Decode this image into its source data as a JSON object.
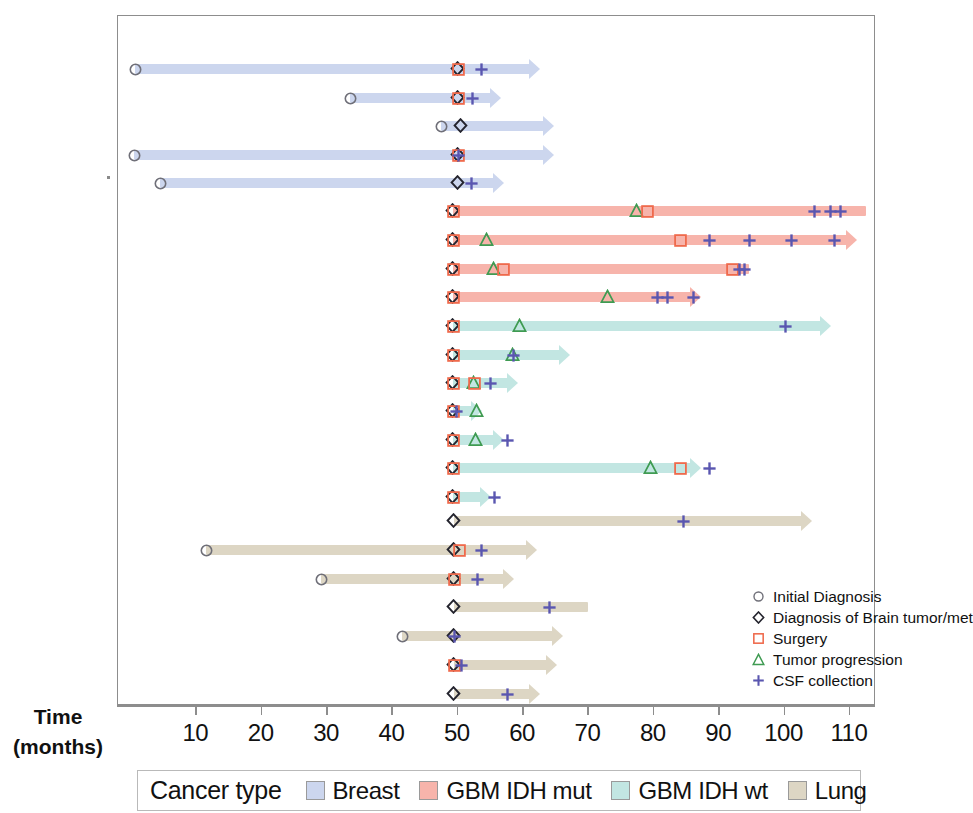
{
  "axis": {
    "title_line1": "Time",
    "title_line2": "(months)",
    "ticks": [
      10,
      20,
      30,
      40,
      50,
      60,
      70,
      80,
      90,
      100,
      110
    ],
    "tick_labels": [
      "10",
      "20",
      "30",
      "40",
      "50",
      "60",
      "70",
      "80",
      "90",
      "100",
      "110"
    ],
    "range": [
      0,
      116
    ]
  },
  "event_legend": {
    "items": [
      {
        "glyph": "circle-icon",
        "label": "Initial Diagnosis",
        "color": "#6f6f78"
      },
      {
        "glyph": "diamond-icon",
        "label": "Diagnosis of Brain tumor/met",
        "color": "#24242e"
      },
      {
        "glyph": "square-icon",
        "label": "Surgery",
        "color": "#ef6a4c"
      },
      {
        "glyph": "triangle-icon",
        "label": "Tumor progression",
        "color": "#3f9b52"
      },
      {
        "glyph": "plus-icon",
        "label": "CSF collection",
        "color": "#5a56b0"
      }
    ]
  },
  "cancer_legend": {
    "title": "Cancer type",
    "items": [
      {
        "label": "Breast",
        "color": "#ccd6ee"
      },
      {
        "label": "GBM IDH mut",
        "color": "#f7b4ab"
      },
      {
        "label": "GBM IDH wt",
        "color": "#c2e6e2"
      },
      {
        "label": "Lung",
        "color": "#ddd6c4"
      }
    ]
  },
  "chart_data": {
    "type": "timeline",
    "title": "",
    "xlabel": "Time (months)",
    "ylabel": "",
    "xlim": [
      0,
      116
    ],
    "grid": false,
    "legend_position": "inside-bottom-right",
    "event_types": [
      "Initial Diagnosis",
      "Diagnosis of Brain tumor/met",
      "Surgery",
      "Tumor progression",
      "CSF collection"
    ],
    "group_colors": {
      "Breast": "#ccd6ee",
      "GBM IDH mut": "#f7b4ab",
      "GBM IDH wt": "#c2e6e2",
      "Lung": "#ddd6c4"
    },
    "marker_colors": {
      "initial": "#6f6f78",
      "brain": "#24242e",
      "surgery": "#ef6a4c",
      "progression": "#3f9b52",
      "csf": "#5a56b0"
    },
    "rows": [
      {
        "id": 1,
        "group": "Breast",
        "start": 0.6,
        "end": 62.5,
        "arrow": true,
        "events": [
          {
            "t": 0.6,
            "type": "initial"
          },
          {
            "t": 50.0,
            "type": "brain"
          },
          {
            "t": 50.0,
            "type": "surgery"
          },
          {
            "t": 53.5,
            "type": "csf"
          }
        ]
      },
      {
        "id": 2,
        "group": "Breast",
        "start": 33.5,
        "end": 56.5,
        "arrow": true,
        "events": [
          {
            "t": 33.5,
            "type": "initial"
          },
          {
            "t": 50.0,
            "type": "brain"
          },
          {
            "t": 50.0,
            "type": "surgery"
          },
          {
            "t": 52.2,
            "type": "csf"
          }
        ]
      },
      {
        "id": 3,
        "group": "Breast",
        "start": 47.5,
        "end": 64.5,
        "arrow": true,
        "events": [
          {
            "t": 47.5,
            "type": "initial"
          },
          {
            "t": 50.5,
            "type": "brain"
          }
        ]
      },
      {
        "id": 4,
        "group": "Breast",
        "start": 0.4,
        "end": 64.5,
        "arrow": true,
        "events": [
          {
            "t": 0.4,
            "type": "initial"
          },
          {
            "t": 50.0,
            "type": "brain"
          },
          {
            "t": 50.0,
            "type": "surgery"
          },
          {
            "t": 50.0,
            "type": "csf"
          }
        ]
      },
      {
        "id": 5,
        "group": "Breast",
        "start": 4.5,
        "end": 57.0,
        "arrow": true,
        "events": [
          {
            "t": 4.5,
            "type": "initial"
          },
          {
            "t": 50.0,
            "type": "brain"
          },
          {
            "t": 52.0,
            "type": "csf"
          }
        ]
      },
      {
        "id": 6,
        "group": "GBM IDH mut",
        "start": 49.3,
        "end": 112.5,
        "arrow": false,
        "events": [
          {
            "t": 49.3,
            "type": "brain"
          },
          {
            "t": 49.3,
            "type": "surgery"
          },
          {
            "t": 77.5,
            "type": "progression"
          },
          {
            "t": 79.0,
            "type": "surgery"
          },
          {
            "t": 104.5,
            "type": "csf"
          },
          {
            "t": 107.0,
            "type": "csf"
          },
          {
            "t": 108.5,
            "type": "csf"
          }
        ]
      },
      {
        "id": 7,
        "group": "GBM IDH mut",
        "start": 49.3,
        "end": 111.0,
        "arrow": true,
        "events": [
          {
            "t": 49.3,
            "type": "brain"
          },
          {
            "t": 49.3,
            "type": "surgery"
          },
          {
            "t": 54.5,
            "type": "progression"
          },
          {
            "t": 84.0,
            "type": "surgery"
          },
          {
            "t": 88.5,
            "type": "csf"
          },
          {
            "t": 94.5,
            "type": "csf"
          },
          {
            "t": 101.0,
            "type": "csf"
          },
          {
            "t": 107.5,
            "type": "csf"
          }
        ]
      },
      {
        "id": 8,
        "group": "GBM IDH mut",
        "start": 49.3,
        "end": 94.5,
        "arrow": false,
        "events": [
          {
            "t": 49.3,
            "type": "brain"
          },
          {
            "t": 49.3,
            "type": "surgery"
          },
          {
            "t": 55.5,
            "type": "progression"
          },
          {
            "t": 57.0,
            "type": "surgery"
          },
          {
            "t": 92.0,
            "type": "surgery"
          },
          {
            "t": 93.0,
            "type": "csf"
          },
          {
            "t": 93.8,
            "type": "csf"
          }
        ]
      },
      {
        "id": 9,
        "group": "GBM IDH mut",
        "start": 49.3,
        "end": 87.0,
        "arrow": true,
        "events": [
          {
            "t": 49.3,
            "type": "brain"
          },
          {
            "t": 49.3,
            "type": "surgery"
          },
          {
            "t": 73.0,
            "type": "progression"
          },
          {
            "t": 80.5,
            "type": "csf"
          },
          {
            "t": 82.0,
            "type": "csf"
          },
          {
            "t": 86.0,
            "type": "csf"
          }
        ]
      },
      {
        "id": 10,
        "group": "GBM IDH wt",
        "start": 49.3,
        "end": 107.0,
        "arrow": true,
        "events": [
          {
            "t": 49.3,
            "type": "brain"
          },
          {
            "t": 49.3,
            "type": "surgery"
          },
          {
            "t": 59.5,
            "type": "progression"
          },
          {
            "t": 100.0,
            "type": "csf"
          }
        ]
      },
      {
        "id": 11,
        "group": "GBM IDH wt",
        "start": 49.3,
        "end": 67.0,
        "arrow": true,
        "events": [
          {
            "t": 49.3,
            "type": "brain"
          },
          {
            "t": 49.3,
            "type": "surgery"
          },
          {
            "t": 58.5,
            "type": "progression"
          },
          {
            "t": 58.5,
            "type": "csf"
          }
        ]
      },
      {
        "id": 12,
        "group": "GBM IDH wt",
        "start": 49.3,
        "end": 59.0,
        "arrow": true,
        "events": [
          {
            "t": 49.3,
            "type": "brain"
          },
          {
            "t": 49.3,
            "type": "surgery"
          },
          {
            "t": 52.5,
            "type": "progression"
          },
          {
            "t": 52.5,
            "type": "surgery"
          },
          {
            "t": 55.0,
            "type": "csf"
          }
        ]
      },
      {
        "id": 13,
        "group": "GBM IDH wt",
        "start": 49.3,
        "end": 53.5,
        "arrow": true,
        "events": [
          {
            "t": 49.3,
            "type": "brain"
          },
          {
            "t": 49.3,
            "type": "surgery"
          },
          {
            "t": 49.8,
            "type": "csf"
          },
          {
            "t": 53.0,
            "type": "progression"
          }
        ]
      },
      {
        "id": 14,
        "group": "GBM IDH wt",
        "start": 49.3,
        "end": 57.0,
        "arrow": true,
        "events": [
          {
            "t": 49.3,
            "type": "brain"
          },
          {
            "t": 49.3,
            "type": "surgery"
          },
          {
            "t": 52.8,
            "type": "progression"
          },
          {
            "t": 57.5,
            "type": "csf"
          }
        ]
      },
      {
        "id": 15,
        "group": "GBM IDH wt",
        "start": 49.3,
        "end": 87.0,
        "arrow": true,
        "events": [
          {
            "t": 49.3,
            "type": "brain"
          },
          {
            "t": 49.3,
            "type": "surgery"
          },
          {
            "t": 79.5,
            "type": "progression"
          },
          {
            "t": 84.0,
            "type": "surgery"
          },
          {
            "t": 88.5,
            "type": "csf"
          }
        ]
      },
      {
        "id": 16,
        "group": "GBM IDH wt",
        "start": 49.3,
        "end": 55.0,
        "arrow": true,
        "events": [
          {
            "t": 49.3,
            "type": "brain"
          },
          {
            "t": 49.3,
            "type": "surgery"
          },
          {
            "t": 55.5,
            "type": "csf"
          }
        ]
      },
      {
        "id": 17,
        "group": "Lung",
        "start": 49.5,
        "end": 104.0,
        "arrow": true,
        "events": [
          {
            "t": 49.5,
            "type": "brain"
          },
          {
            "t": 84.5,
            "type": "csf"
          }
        ]
      },
      {
        "id": 18,
        "group": "Lung",
        "start": 11.5,
        "end": 62.0,
        "arrow": true,
        "events": [
          {
            "t": 11.5,
            "type": "initial"
          },
          {
            "t": 49.5,
            "type": "brain"
          },
          {
            "t": 50.2,
            "type": "surgery"
          },
          {
            "t": 53.5,
            "type": "csf"
          }
        ]
      },
      {
        "id": 19,
        "group": "Lung",
        "start": 29.0,
        "end": 58.5,
        "arrow": true,
        "events": [
          {
            "t": 29.0,
            "type": "initial"
          },
          {
            "t": 49.5,
            "type": "brain"
          },
          {
            "t": 49.5,
            "type": "surgery"
          },
          {
            "t": 53.0,
            "type": "csf"
          }
        ]
      },
      {
        "id": 20,
        "group": "Lung",
        "start": 49.5,
        "end": 70.0,
        "arrow": false,
        "events": [
          {
            "t": 49.5,
            "type": "brain"
          },
          {
            "t": 64.0,
            "type": "csf"
          }
        ]
      },
      {
        "id": 21,
        "group": "Lung",
        "start": 41.5,
        "end": 66.0,
        "arrow": true,
        "events": [
          {
            "t": 41.5,
            "type": "initial"
          },
          {
            "t": 49.5,
            "type": "brain"
          },
          {
            "t": 49.5,
            "type": "csf"
          }
        ]
      },
      {
        "id": 22,
        "group": "Lung",
        "start": 49.5,
        "end": 65.0,
        "arrow": true,
        "events": [
          {
            "t": 49.5,
            "type": "brain"
          },
          {
            "t": 49.5,
            "type": "surgery"
          },
          {
            "t": 50.5,
            "type": "csf"
          }
        ]
      },
      {
        "id": 23,
        "group": "Lung",
        "start": 49.5,
        "end": 62.5,
        "arrow": true,
        "events": [
          {
            "t": 49.5,
            "type": "brain"
          },
          {
            "t": 57.5,
            "type": "csf"
          }
        ]
      }
    ]
  }
}
